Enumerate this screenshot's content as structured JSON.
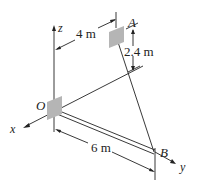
{
  "diagram": {
    "type": "3D statics figure",
    "points": [
      {
        "id": "O",
        "label": "O"
      },
      {
        "id": "A",
        "label": "A"
      },
      {
        "id": "B",
        "label": "B"
      }
    ],
    "axes": {
      "x": "x",
      "y": "y",
      "z": "z"
    },
    "dimensions": {
      "oa_horizontal": "4 m",
      "a_height": "2.4 m",
      "ob_length": "6 m"
    },
    "members": [
      {
        "from": "O",
        "to": "B",
        "kind": "rod"
      },
      {
        "from": "A",
        "to": "B",
        "kind": "cable"
      }
    ],
    "colors": {
      "line": "#222222",
      "plate": "#b5b5b5"
    }
  }
}
